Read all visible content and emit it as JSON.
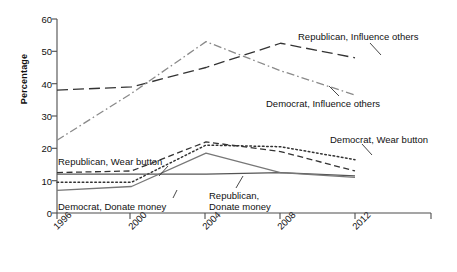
{
  "chart_data": {
    "type": "line",
    "title": "",
    "xlabel": "",
    "ylabel": "Percentage",
    "categories": [
      "1996",
      "2000",
      "2004",
      "2008",
      "2012"
    ],
    "x_tick_labels": [
      "1996",
      "2000",
      "2004",
      "2008",
      "2012"
    ],
    "y_tick_labels": [
      "0",
      "10",
      "20",
      "30",
      "40",
      "50",
      "60"
    ],
    "y_ticks": [
      0,
      10,
      20,
      30,
      40,
      50,
      60
    ],
    "ylim": [
      0,
      60
    ],
    "grid": false,
    "legend_position": "inline-annotations",
    "series": [
      {
        "name": "Republican, Influence others",
        "style": "long-dash",
        "color": "#333333",
        "values": [
          38,
          39,
          45,
          52.5,
          48
        ]
      },
      {
        "name": "Democrat, Influence others",
        "style": "dash-dot",
        "color": "#8a8a8a",
        "values": [
          22.5,
          37,
          53,
          44,
          36.5
        ]
      },
      {
        "name": "Republican, Wear button",
        "style": "short-dash",
        "color": "#333333",
        "values": [
          12.5,
          13,
          22,
          19,
          13
        ]
      },
      {
        "name": "Democrat, Wear button",
        "style": "dotted",
        "color": "#333333",
        "values": [
          9.5,
          9.5,
          21,
          20.5,
          16.5
        ]
      },
      {
        "name": "Republican, Donate money",
        "style": "solid",
        "color": "#555555",
        "values": [
          12,
          12,
          12,
          12.5,
          11.5
        ]
      },
      {
        "name": "Democrat, Donate money",
        "style": "solid",
        "color": "#777777",
        "values": [
          7,
          8.2,
          18.5,
          12.5,
          11
        ]
      }
    ],
    "annotations": [
      {
        "text": "Republican, Influence others",
        "series": "Republican, Influence others"
      },
      {
        "text": "Democrat, Influence others",
        "series": "Democrat, Influence others"
      },
      {
        "text": "Republican, Wear button",
        "series": "Republican, Wear button"
      },
      {
        "text": "Democrat, Wear button",
        "series": "Democrat, Wear button"
      },
      {
        "text": "Democrat, Donate money",
        "series": "Democrat, Donate money"
      },
      {
        "text": "Republican,",
        "series": "Republican, Donate money"
      },
      {
        "text": "Donate money",
        "series": "Republican, Donate money"
      }
    ]
  },
  "axis": {
    "y_label": "Percentage"
  },
  "labels": {
    "rep_influence": "Republican, Influence others",
    "dem_influence": "Democrat, Influence others",
    "rep_wear": "Republican, Wear button",
    "dem_wear": "Democrat, Wear button",
    "dem_donate": "Democrat, Donate money",
    "rep_donate_line1": "Republican,",
    "rep_donate_line2": "Donate money"
  },
  "y_ticks": {
    "t0": "0",
    "t1": "10",
    "t2": "20",
    "t3": "30",
    "t4": "40",
    "t5": "50",
    "t6": "60"
  },
  "x_ticks": {
    "t0": "1996",
    "t1": "2000",
    "t2": "2004",
    "t3": "2008",
    "t4": "2012"
  }
}
